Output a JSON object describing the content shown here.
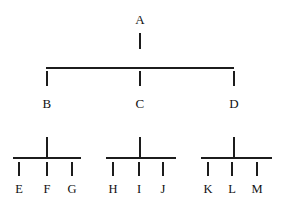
{
  "diagram": {
    "type": "hierarchy-tree",
    "orientation": "top-down",
    "levels": 3,
    "stroke_color": "#1c1c1c",
    "text_color": "#111111",
    "background_color": "#ffffff",
    "root": {
      "label": "A",
      "x": 140,
      "label_y": 22
    },
    "level1_bar": {
      "x_start": 46,
      "x_end": 234,
      "y": 67
    },
    "level1": [
      {
        "label": "B",
        "x": 47,
        "label_y": 105
      },
      {
        "label": "C",
        "x": 140,
        "label_y": 105
      },
      {
        "label": "D",
        "x": 234,
        "label_y": 105
      }
    ],
    "groups": [
      {
        "parent": "B",
        "stem_x": 47,
        "bar_x_start": 13,
        "bar_x_end": 81,
        "bar_y": 157,
        "leaves": [
          {
            "label": "E",
            "x": 19
          },
          {
            "label": "F",
            "x": 47
          },
          {
            "label": "G",
            "x": 72
          }
        ]
      },
      {
        "parent": "C",
        "stem_x": 140,
        "bar_x_start": 106,
        "bar_x_end": 176,
        "bar_y": 157,
        "leaves": [
          {
            "label": "H",
            "x": 113
          },
          {
            "label": "I",
            "x": 139
          },
          {
            "label": "J",
            "x": 163
          }
        ]
      },
      {
        "parent": "D",
        "stem_x": 234,
        "bar_x_start": 201,
        "bar_x_end": 272,
        "bar_y": 157,
        "leaves": [
          {
            "label": "K",
            "x": 208
          },
          {
            "label": "L",
            "x": 232
          },
          {
            "label": "M",
            "x": 257
          }
        ]
      }
    ],
    "leaf_label_y": 190
  }
}
